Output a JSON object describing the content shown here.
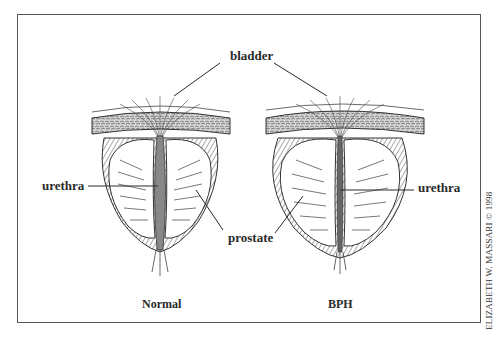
{
  "figure": {
    "labels": {
      "bladder": "bladder",
      "urethra_left": "urethra",
      "urethra_right": "urethra",
      "prostate": "prostate"
    },
    "captions": {
      "left": "Normal",
      "right": "BPH"
    },
    "credit": "ELIZABETH W. MASSARI © 1998",
    "colors": {
      "line": "#2a2a2a",
      "frame": "#555555",
      "background": "#ffffff"
    }
  }
}
